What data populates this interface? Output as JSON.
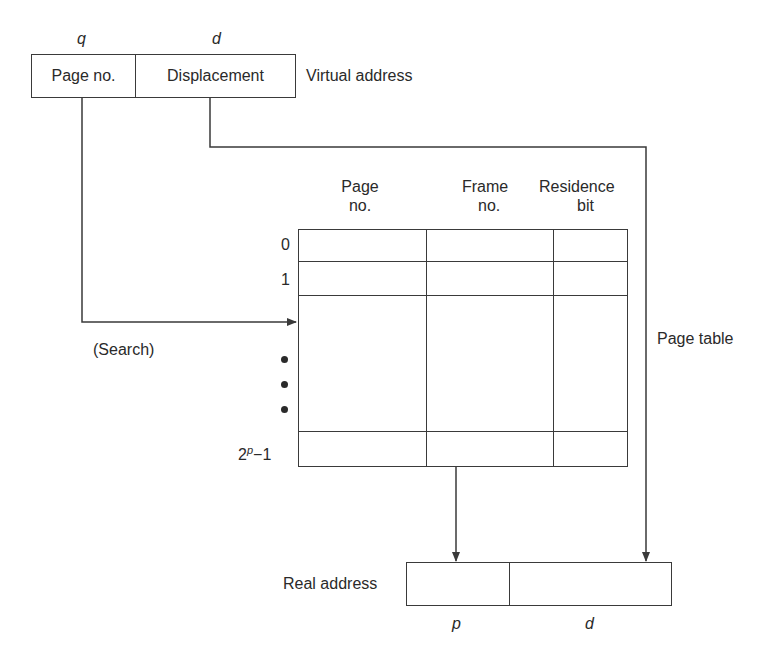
{
  "virtual_address": {
    "label": "Virtual address",
    "field_symbols": {
      "page": "q",
      "displacement": "d"
    },
    "fields": {
      "page": "Page no.",
      "displacement": "Displacement"
    }
  },
  "page_table": {
    "label": "Page table",
    "columns": [
      {
        "line1": "Page",
        "line2": "no."
      },
      {
        "line1": "Frame",
        "line2": "no."
      },
      {
        "line1": "Residence",
        "line2": "bit"
      }
    ],
    "row_labels": {
      "first": "0",
      "second": "1",
      "last_base": "2",
      "last_exp": "p",
      "last_suffix": "−1"
    },
    "ellipsis": "vertical-dots"
  },
  "search_label": "(Search)",
  "real_address": {
    "label": "Real address",
    "field_symbols": {
      "frame": "p",
      "displacement": "d"
    }
  },
  "colors": {
    "line": "#3a3a3a",
    "text": "#2a2a2a",
    "background": "#ffffff"
  }
}
